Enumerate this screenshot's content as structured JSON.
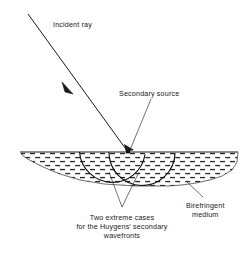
{
  "figure": {
    "background_color": "#ffffff",
    "ink_color": "#1a1a1a",
    "width": 244,
    "height": 255
  },
  "labels": {
    "incident_ray": "Incident ray",
    "secondary_source": "Secondary source",
    "birefringent_line1": "Birefringent",
    "birefringent_line2": "medium",
    "wavefronts_line1": "Two extreme cases",
    "wavefronts_line2": "for the Huygens' secondary",
    "wavefronts_line3": "wavefronts"
  },
  "geometry": {
    "incident_ray": {
      "start_x": 28,
      "start_y": 14,
      "end_x": 128,
      "end_y": 152,
      "arrow_x": 67,
      "arrow_y": 88
    },
    "surface": {
      "left_x": 20,
      "right_x": 238,
      "y": 152
    },
    "medium": {
      "top_y": 152,
      "max_depth_y": 186,
      "left_x": 20,
      "right_x": 238
    },
    "secondary_source_point": {
      "x": 128,
      "y": 152
    },
    "arc_left": {
      "cx": 112,
      "cy": 152,
      "r": 33
    },
    "arc_right": {
      "cx": 142,
      "cy": 152,
      "r": 33
    },
    "leader_birefringent": {
      "x1": 203,
      "y1": 197,
      "x2": 186,
      "y2": 181
    },
    "leader_wavefronts": {
      "apex_x": 122,
      "apex_y": 207,
      "tip1_x": 109,
      "tip1_y": 176,
      "tip2_x": 138,
      "tip2_y": 176
    },
    "leader_secondary_source": {
      "x1": 151,
      "y1": 99,
      "x2": 129,
      "y2": 151
    }
  },
  "text_positions": {
    "incident_ray": {
      "x": 53,
      "y": 27
    },
    "secondary_source": {
      "x": 119,
      "y": 96
    },
    "birefringent_line1": {
      "x": 186,
      "y": 208
    },
    "birefringent_line2": {
      "x": 191,
      "y": 217
    },
    "wavefronts_line1": {
      "x": 122,
      "y": 220
    },
    "wavefronts_line2": {
      "x": 122,
      "y": 229
    },
    "wavefronts_line3": {
      "x": 122,
      "y": 238
    }
  },
  "hatch": {
    "pattern": "staggered horizontal dashes",
    "dash_color": "#2b2b2b",
    "row_spacing": 4.0,
    "dash_length": 5.0,
    "dash_height": 1.35
  }
}
